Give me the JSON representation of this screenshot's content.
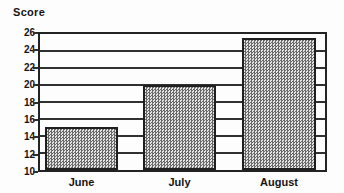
{
  "chart_data": {
    "type": "bar",
    "title": "Score",
    "categories": [
      "June",
      "July",
      "August"
    ],
    "values": [
      15,
      20,
      25.5
    ],
    "xlabel": "",
    "ylabel": "Score",
    "ylim": [
      10,
      26
    ],
    "yticks": [
      26,
      24,
      22,
      20,
      18,
      16,
      14,
      12,
      10
    ],
    "grid": "horizontal gridlines every 2 units",
    "legend": "none",
    "colors": {
      "line": "#232323",
      "bar_fill_dark": "#696969",
      "bar_fill_light": "#e4e4e4",
      "background": "#fdfdfd",
      "text": "#141414"
    }
  }
}
